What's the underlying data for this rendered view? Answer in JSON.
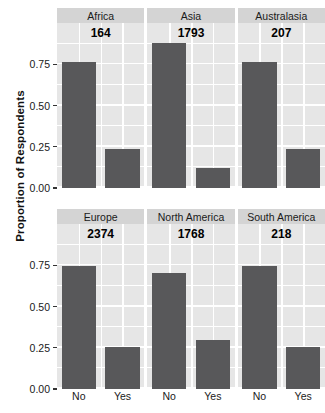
{
  "chart_data": {
    "type": "bar",
    "title": "",
    "xlabel": "",
    "ylabel": "Proportion of Respondents",
    "ylim": [
      0,
      1.0
    ],
    "ytick_values": [
      0.0,
      0.25,
      0.5,
      0.75
    ],
    "ytick_labels": [
      "0.00",
      "0.25",
      "0.50",
      "0.75"
    ],
    "categories": [
      "No",
      "Yes"
    ],
    "grid": true,
    "legend": "none",
    "facet_layout": {
      "rows": 2,
      "cols": 3
    },
    "panels": [
      {
        "name": "Africa",
        "count_label": "164",
        "categories": [
          "No",
          "Yes"
        ],
        "values": [
          0.765,
          0.235
        ]
      },
      {
        "name": "Asia",
        "count_label": "1793",
        "categories": [
          "No",
          "Yes"
        ],
        "values": [
          0.88,
          0.12
        ]
      },
      {
        "name": "Australasia",
        "count_label": "207",
        "categories": [
          "No",
          "Yes"
        ],
        "values": [
          0.763,
          0.237
        ]
      },
      {
        "name": "Europe",
        "count_label": "2374",
        "categories": [
          "No",
          "Yes"
        ],
        "values": [
          0.745,
          0.255
        ]
      },
      {
        "name": "North America",
        "count_label": "1768",
        "categories": [
          "No",
          "Yes"
        ],
        "values": [
          0.705,
          0.295
        ]
      },
      {
        "name": "South America",
        "count_label": "218",
        "categories": [
          "No",
          "Yes"
        ],
        "values": [
          0.745,
          0.255
        ]
      }
    ]
  },
  "colors": {
    "bar_fill": "#58585a",
    "panel_background": "#e6e6e6",
    "strip_background": "#d4d4d4",
    "gridline": "#ffffff",
    "text": "#1a1a1a",
    "page_background": "#ffffff"
  }
}
